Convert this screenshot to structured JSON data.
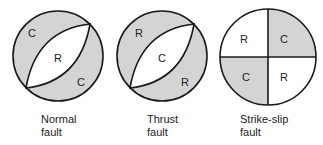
{
  "colors": {
    "shade": "#d4d4d4",
    "line": "#1a1a1a",
    "background": "#ffffff"
  },
  "diagrams": [
    {
      "name": "normal",
      "caption_line1": "Normal",
      "caption_line2": "fault",
      "labels": {
        "top_left": "C",
        "center": "R",
        "bottom_right": "C"
      }
    },
    {
      "name": "thrust",
      "caption_line1": "Thrust",
      "caption_line2": "fault",
      "labels": {
        "top_left": "R",
        "center": "C",
        "bottom_right": "R"
      }
    },
    {
      "name": "strike-slip",
      "caption_line1": "Strike-slip",
      "caption_line2": "fault",
      "labels": {
        "top_left": "R",
        "top_right": "C",
        "bottom_left": "C",
        "bottom_right": "R"
      }
    }
  ]
}
